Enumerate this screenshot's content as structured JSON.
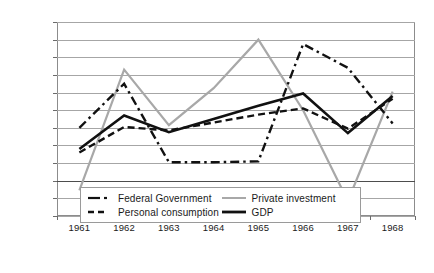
{
  "chart_data": {
    "type": "line",
    "title": "",
    "xlabel": "",
    "ylabel": "",
    "categories": [
      "1961",
      "1962",
      "1963",
      "1964",
      "1965",
      "1966",
      "1967",
      "1968"
    ],
    "x": [
      1961,
      1962,
      1963,
      1964,
      1965,
      1966,
      1967,
      1968
    ],
    "ylim": [
      -4,
      18
    ],
    "ytick_labels": [
      "18%",
      "16%",
      "14%",
      "12%",
      "10%",
      "8%",
      "6%",
      "4%",
      "2%",
      "0%",
      "-2%",
      "-4%"
    ],
    "ytick_values": [
      18,
      16,
      14,
      12,
      10,
      8,
      6,
      4,
      2,
      0,
      -2,
      -4
    ],
    "grid": true,
    "legend_position": "bottom-center",
    "series": [
      {
        "name": "Federal Government",
        "style": "dash-dot",
        "color": "#111111",
        "values": [
          6.0,
          11.0,
          2.1,
          2.1,
          2.2,
          15.5,
          12.8,
          6.5
        ]
      },
      {
        "name": "Personal consumption",
        "style": "dashed",
        "color": "#111111",
        "values": [
          3.2,
          6.1,
          5.7,
          6.6,
          7.5,
          8.2,
          5.9,
          9.3
        ]
      },
      {
        "name": "Private investment",
        "style": "solid",
        "color": "#a8a8a8",
        "values": [
          -1.1,
          12.6,
          6.3,
          10.5,
          16.0,
          8.0,
          -2.3,
          10.1
        ]
      },
      {
        "name": "GDP",
        "style": "solid",
        "color": "#111111",
        "values": [
          3.6,
          7.4,
          5.5,
          7.0,
          8.5,
          9.9,
          5.4,
          9.6
        ]
      }
    ]
  },
  "legend": {
    "items": [
      {
        "label": "Federal Government",
        "swatch": "dash-dot-black"
      },
      {
        "label": "Private investment",
        "swatch": "solid-gray"
      },
      {
        "label": "Personal consumption",
        "swatch": "dashed-black"
      },
      {
        "label": "GDP",
        "swatch": "solid-black-thick"
      }
    ]
  }
}
